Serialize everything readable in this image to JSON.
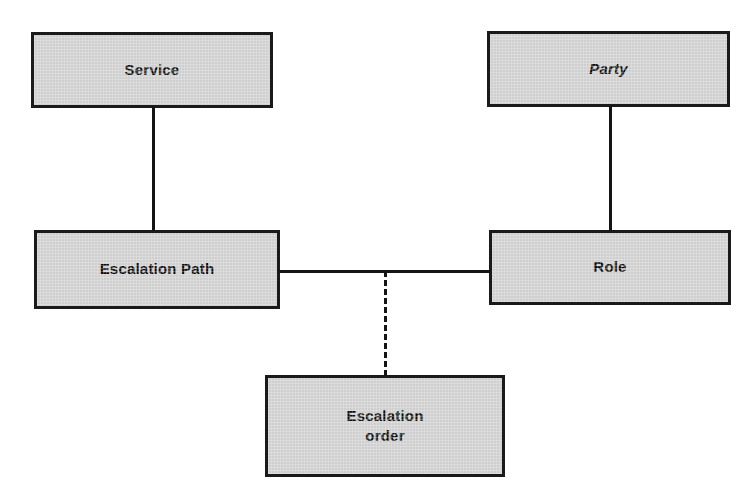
{
  "diagram": {
    "type": "uml-class-diagram",
    "background_color": "#ffffff",
    "node_fill_color": "#cfcfcf",
    "node_border_color": "#1a1a1a",
    "edge_color": "#141414",
    "nodes": [
      {
        "id": "service",
        "label": "Service",
        "style": "bold",
        "x": 31,
        "y": 32,
        "width": 242,
        "height": 76
      },
      {
        "id": "party",
        "label": "Party",
        "style": "bold-italic",
        "x": 487,
        "y": 31,
        "width": 243,
        "height": 76
      },
      {
        "id": "escalation-path",
        "label": "Escalation  Path",
        "style": "bold",
        "x": 34,
        "y": 230,
        "width": 246,
        "height": 79
      },
      {
        "id": "role",
        "label": "Role",
        "style": "bold",
        "x": 489,
        "y": 230,
        "width": 242,
        "height": 75
      },
      {
        "id": "escalation-order",
        "label": "Escalation\norder",
        "style": "bold",
        "x": 265,
        "y": 375,
        "width": 240,
        "height": 102
      }
    ],
    "edges": [
      {
        "id": "service-to-escalation-path",
        "from": "service",
        "to": "escalation-path",
        "line_style": "solid",
        "orientation": "vertical",
        "x": 152,
        "y": 107,
        "length": 124
      },
      {
        "id": "party-to-role",
        "from": "party",
        "to": "role",
        "line_style": "solid",
        "orientation": "vertical",
        "x": 609,
        "y": 106,
        "length": 125
      },
      {
        "id": "escalation-path-to-role",
        "from": "escalation-path",
        "to": "role",
        "line_style": "solid",
        "orientation": "horizontal",
        "x": 278,
        "y": 270,
        "length": 213
      },
      {
        "id": "association-class-link",
        "from": "escalation-path-to-role",
        "to": "escalation-order",
        "line_style": "dashed",
        "orientation": "vertical",
        "x": 384,
        "y": 271,
        "length": 105
      }
    ]
  }
}
